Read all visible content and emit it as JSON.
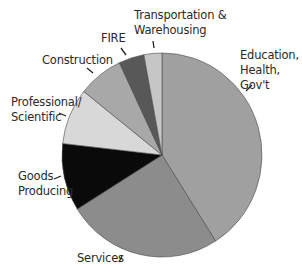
{
  "chart_data": {
    "type": "pie",
    "title": "",
    "start_angle_deg": 0,
    "direction": "clockwise",
    "slices": [
      {
        "label": "Education, Health, Gov't",
        "value": 41.0,
        "color": "#a0a0a0"
      },
      {
        "label": "Services",
        "value": 25.1,
        "color": "#8c8c8c"
      },
      {
        "label": "Goods Producing",
        "value": 10.7,
        "color": "#0a0a0a"
      },
      {
        "label": "Professional/ Scientific",
        "value": 8.9,
        "color": "#d8d8d8"
      },
      {
        "label": "Construction",
        "value": 7.3,
        "color": "#a8a8a8"
      },
      {
        "label": "FIRE",
        "value": 4.1,
        "color": "#585858"
      },
      {
        "label": "Transportation & Warehousing",
        "value": 2.9,
        "color": "#c6c6c6"
      }
    ],
    "categories": [
      "Education, Health, Gov't",
      "Services",
      "Goods Producing",
      "Professional/ Scientific",
      "Construction",
      "FIRE",
      "Transportation & Warehousing"
    ],
    "values": [
      41.0,
      25.1,
      10.7,
      8.9,
      7.3,
      4.1,
      2.9
    ],
    "legend": "none (direct labels with leader lines)"
  },
  "labels": {
    "education": "Education,\nHealth,\nGov't",
    "services": "Services",
    "goods": "Goods\nProducing",
    "professional": "Professional/\nScientific",
    "construction": "Construction",
    "fire": "FIRE",
    "transportation": "Transportation &\nWarehousing"
  }
}
